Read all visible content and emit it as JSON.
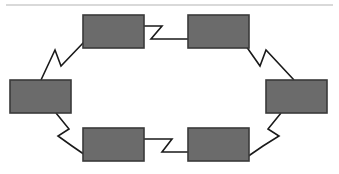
{
  "figure": {
    "type": "ring-diagram",
    "background_color": "#ffffff",
    "width": 339,
    "height": 174
  },
  "rule": {
    "name": "top-horizontal-rule",
    "color": "#d9d9d9",
    "x1": 6,
    "x2": 333,
    "y": 5,
    "thickness": 1.4
  },
  "style": {
    "node_fill": "#6b6b6b",
    "node_stroke": "#3a3a3a",
    "node_stroke_width": 1.6,
    "connector_stroke": "#1a1a1a",
    "connector_stroke_width": 1.6
  },
  "nodes": [
    {
      "id": "node-top-left",
      "label": "",
      "x": 83,
      "y": 15,
      "w": 61,
      "h": 33
    },
    {
      "id": "node-top-right",
      "label": "",
      "x": 188,
      "y": 15,
      "w": 61,
      "h": 33
    },
    {
      "id": "node-right",
      "label": "",
      "x": 266,
      "y": 80,
      "w": 61,
      "h": 33
    },
    {
      "id": "node-bottom-right",
      "label": "",
      "x": 188,
      "y": 128,
      "w": 61,
      "h": 33
    },
    {
      "id": "node-bottom-left",
      "label": "",
      "x": 83,
      "y": 128,
      "w": 61,
      "h": 33
    },
    {
      "id": "node-left",
      "label": "",
      "x": 10,
      "y": 80,
      "w": 61,
      "h": 33
    }
  ],
  "connectors": [
    {
      "id": "connector-top",
      "from": "node-top-left",
      "to": "node-top-right",
      "points": "144,26 162,26 151,39 188,39"
    },
    {
      "id": "connector-top-right",
      "from": "node-top-right",
      "to": "node-right",
      "points": "246,46 260,66 266,50 294,80"
    },
    {
      "id": "connector-bottom-right",
      "from": "node-right",
      "to": "node-bottom-right",
      "points": "281,113 268,129 279,136 263,146 247,157"
    },
    {
      "id": "connector-bottom",
      "from": "node-bottom-right",
      "to": "node-bottom-left",
      "points": "188,152 162,152 172,139 144,139"
    },
    {
      "id": "connector-bottom-left",
      "from": "node-bottom-left",
      "to": "node-left",
      "points": "88,157 72,146 58,136 69,129 56,113"
    },
    {
      "id": "connector-top-left",
      "from": "node-left",
      "to": "node-top-left",
      "points": "41,80 55,50 61,66 84,42"
    }
  ]
}
